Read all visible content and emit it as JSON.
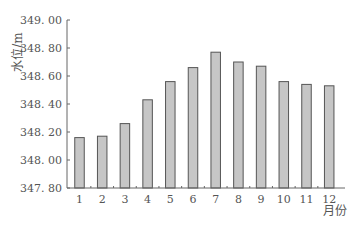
{
  "chart_data": {
    "type": "bar",
    "title": "",
    "xlabel": "月份",
    "ylabel": "水位/m",
    "categories": [
      "1",
      "2",
      "3",
      "4",
      "5",
      "6",
      "7",
      "8",
      "9",
      "10",
      "11",
      "12"
    ],
    "values": [
      348.16,
      348.17,
      348.26,
      348.43,
      348.56,
      348.66,
      348.77,
      348.7,
      348.67,
      348.56,
      348.54,
      348.53
    ],
    "ylim": [
      347.8,
      349.0
    ],
    "yticks": [
      "347.80",
      "348.00",
      "348.20",
      "348.40",
      "348.60",
      "348.80",
      "349.00"
    ],
    "grid": false,
    "legend": null,
    "colors": {
      "bar_fill": "#c6c6c6",
      "bar_stroke": "#555555",
      "axis": "#666666"
    }
  }
}
